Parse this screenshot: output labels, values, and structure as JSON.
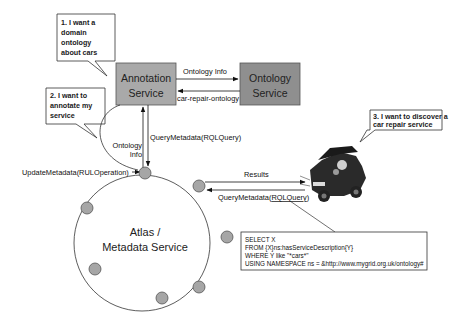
{
  "bubbles": [
    {
      "id": "bubble-1",
      "lines": [
        "1. I want a",
        "domain",
        "ontology",
        "about cars"
      ]
    },
    {
      "id": "bubble-2",
      "lines": [
        "2. I want to",
        "annotate my",
        "service"
      ]
    },
    {
      "id": "bubble-3",
      "lines": [
        "3. I want to discover a",
        "car repair service"
      ]
    }
  ],
  "boxes": {
    "annotation_service": {
      "lines": [
        "Annotation",
        "Service"
      ],
      "fill": "#a9a9a9"
    },
    "ontology_service": {
      "lines": [
        "Ontology",
        "Service"
      ],
      "fill": "#8f8f8f"
    }
  },
  "edges": {
    "ontology_info": "Ontology Info",
    "car_repair_ontology": "car-repair-ontology",
    "query_metadata_top": "QueryMetadata(RQLQuery)",
    "ontology_info_down": [
      "Ontology",
      "Info"
    ],
    "update_metadata": "UpdateMetadata(RULOperation)",
    "results": "Results",
    "query_metadata_client_prefix": "QueryMetadata(",
    "query_metadata_client_arg": "RQLQuery",
    "query_metadata_client_suffix": ")"
  },
  "atlas": {
    "lines": [
      "Atlas /",
      "Metadata Service"
    ],
    "node_fill": "#a6a6a6"
  },
  "query_box": {
    "lines": [
      "SELECT X",
      "FROM {X}ns:hasServiceDescription{Y}",
      "WHERE Y like \"*cars*\"",
      "USING NAMESPACE ns = &http://www.mygrid.org.uk/ontology#"
    ]
  },
  "client": {
    "icon": "car-repair-icon"
  }
}
